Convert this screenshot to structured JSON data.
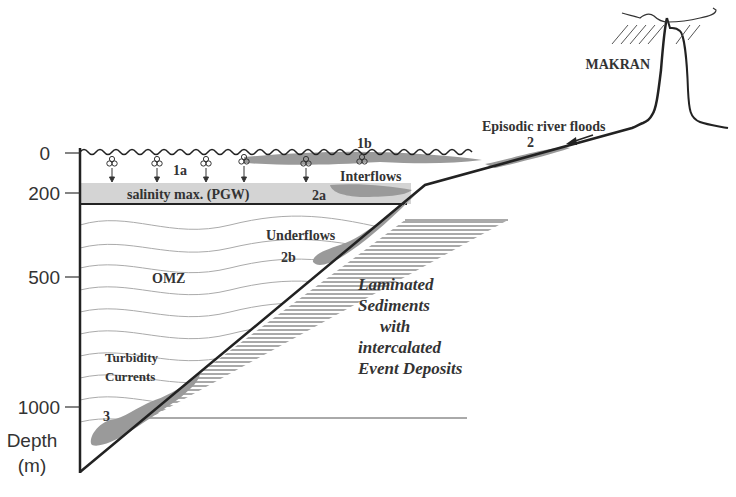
{
  "diagram": {
    "type": "oceanographic cross-section",
    "axis": {
      "ticks": [
        {
          "label": "0",
          "depth_m": 0
        },
        {
          "label": "200",
          "depth_m": 200
        },
        {
          "label": "500",
          "depth_m": 500
        },
        {
          "label": "1000",
          "depth_m": 1000
        }
      ],
      "title_line1": "Depth",
      "title_line2": "(m)"
    },
    "labels": {
      "makran": "MAKRAN",
      "river_floods": "Episodic river floods",
      "river_floods_num": "2",
      "one_a": "1a",
      "one_b": "1b",
      "salinity": "salinity max. (PGW)",
      "two_a": "2a",
      "interflows": "Interflows",
      "underflows": "Underflows",
      "two_b": "2b",
      "omz": "OMZ",
      "turbidity_line1": "Turbidity",
      "turbidity_line2": "Currents",
      "three": "3",
      "sediments_line1": "Laminated",
      "sediments_line2": "Sediments",
      "sediments_line3": "with",
      "sediments_line4": "intercalated",
      "sediments_line5": "Event Deposits"
    },
    "colors": {
      "line": "#222222",
      "plume": "#9a9a9a",
      "salinity_band": "#d4d4d4",
      "contour": "#9a9a9a",
      "text": "#333333"
    }
  }
}
